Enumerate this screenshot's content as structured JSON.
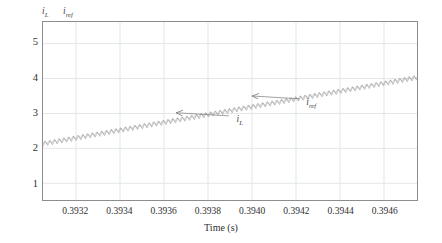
{
  "chart_data": {
    "type": "line",
    "title": "",
    "xlabel": "Time (s)",
    "ylabel": "",
    "xlim": [
      0.39305,
      0.39475
    ],
    "ylim": [
      0.52,
      5.62
    ],
    "grid": true,
    "legend_position": "above-plot-left",
    "xticks": [
      "0.3932",
      "0.3934",
      "0.3936",
      "0.3938",
      "0.3940",
      "0.3942",
      "0.3944",
      "0.3946"
    ],
    "xtick_values": [
      0.3932,
      0.3934,
      0.3936,
      0.3938,
      0.394,
      0.3942,
      0.3944,
      0.3946
    ],
    "yticks": [
      "1",
      "2",
      "3",
      "4",
      "5"
    ],
    "ytick_values": [
      1,
      2,
      3,
      4,
      5
    ],
    "series": [
      {
        "name": "i_L",
        "label_html": "i<sub>L</sub>",
        "color": "#8a8a8a",
        "description": "Inductor current with triangular switching ripple riding on a rising ramp",
        "ramp_start": 2.12,
        "ramp_end": 4.02,
        "ripple_peak_to_peak": 0.13,
        "ripple_period_s": 2.15e-05
      },
      {
        "name": "i_ref",
        "label_html": "i<sub>ref</sub>",
        "color": "#9a9a9a",
        "description": "Reference current, nearly overlapping the inductor current",
        "ramp_start": 2.15,
        "ramp_end": 4.05,
        "ripple_peak_to_peak": 0.1,
        "ripple_period_s": 2.15e-05
      }
    ],
    "annotations": [
      {
        "name": "i_L",
        "label_html": "i<sub>L</sub>",
        "text_x": 0.39393,
        "text_y": 2.82,
        "arrow_from_x": 0.393895,
        "arrow_from_y": 2.93,
        "arrow_to_x": 0.393655,
        "arrow_to_y": 3.02
      },
      {
        "name": "i_ref",
        "label_html": "i<sub>ref</sub>",
        "text_x": 0.394245,
        "text_y": 3.3,
        "arrow_from_x": 0.394215,
        "arrow_from_y": 3.42,
        "arrow_to_x": 0.394,
        "arrow_to_y": 3.5
      }
    ],
    "header_labels": [
      {
        "name": "i_L",
        "label_html": "i<sub>L</sub>"
      },
      {
        "name": "i_ref",
        "label_html": "i<sub>ref</sub>"
      }
    ],
    "colors": {
      "axis": "#8d8d8d",
      "grid": "#e2e6ea",
      "trace": "#8a8a8a",
      "text": "#2f2f2f",
      "annotation": "#7a7a7a"
    }
  }
}
